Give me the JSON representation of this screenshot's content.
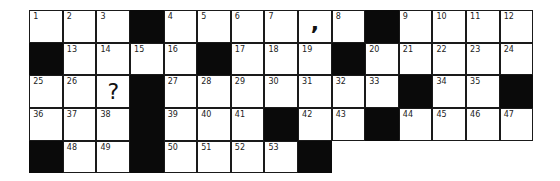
{
  "puzzle": {
    "type": "crossword",
    "cols": 15,
    "rows": 5,
    "grid": [
      [
        {
          "n": "1"
        },
        {
          "n": "2"
        },
        {
          "n": "3"
        },
        {
          "b": true
        },
        {
          "n": "4"
        },
        {
          "n": "5"
        },
        {
          "n": "6"
        },
        {
          "n": "7"
        },
        {
          "g": ",",
          "k": "comma"
        },
        {
          "n": "8"
        },
        {
          "b": true
        },
        {
          "n": "9"
        },
        {
          "n": "10"
        },
        {
          "n": "11"
        },
        {
          "n": "12"
        }
      ],
      [
        {
          "b": true
        },
        {
          "n": "13"
        },
        {
          "n": "14"
        },
        {
          "n": "15"
        },
        {
          "n": "16"
        },
        {
          "b": true
        },
        {
          "n": "17"
        },
        {
          "n": "18"
        },
        {
          "n": "19"
        },
        {
          "b": true
        },
        {
          "n": "20"
        },
        {
          "n": "21"
        },
        {
          "n": "22"
        },
        {
          "n": "23"
        },
        {
          "n": "24"
        }
      ],
      [
        {
          "n": "25"
        },
        {
          "n": "26"
        },
        {
          "g": "?",
          "k": "question"
        },
        {
          "b": true
        },
        {
          "n": "27"
        },
        {
          "n": "28"
        },
        {
          "n": "29"
        },
        {
          "n": "30"
        },
        {
          "n": "31"
        },
        {
          "n": "32"
        },
        {
          "n": "33"
        },
        {
          "b": true
        },
        {
          "n": "34"
        },
        {
          "n": "35"
        },
        {
          "b": true
        }
      ],
      [
        {
          "n": "36"
        },
        {
          "n": "37"
        },
        {
          "n": "38"
        },
        {
          "b": true
        },
        {
          "n": "39"
        },
        {
          "n": "40"
        },
        {
          "n": "41"
        },
        {
          "b": true
        },
        {
          "n": "42"
        },
        {
          "n": "43"
        },
        {
          "b": true
        },
        {
          "n": "44"
        },
        {
          "n": "45"
        },
        {
          "n": "46"
        },
        {
          "n": "47"
        }
      ],
      [
        {
          "b": true
        },
        {
          "n": "48"
        },
        {
          "n": "49"
        },
        {
          "b": true
        },
        {
          "n": "50"
        },
        {
          "n": "51"
        },
        {
          "n": "52"
        },
        {
          "n": "53"
        },
        {
          "b": true
        },
        null,
        null,
        null,
        null,
        null,
        null
      ]
    ],
    "colors": {
      "black_cell": "#0a0a0a",
      "white_cell": "#ffffff",
      "border": "#1a1a1a"
    }
  }
}
